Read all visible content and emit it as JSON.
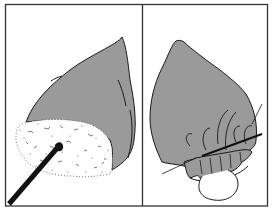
{
  "figure": {
    "type": "two-panel line illustration",
    "panels": [
      {
        "id": "left",
        "description": "Grey teardrop-shaped bulb with white foamy/speckled material at the base being pushed by a black rod"
      },
      {
        "id": "right",
        "description": "Grey teardrop-shaped bulb gathered at the base with a stitched ruffled edge, a needle through it and a loop of thread below"
      }
    ],
    "colors": {
      "fill": "#9a9a9a",
      "line": "#1a1a1a",
      "background": "#ffffff",
      "foam": "#ffffff"
    }
  }
}
